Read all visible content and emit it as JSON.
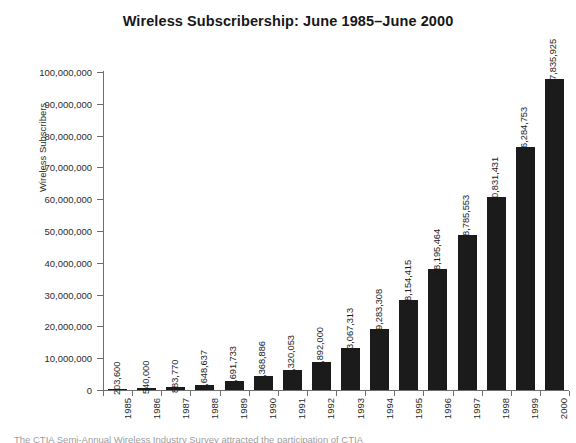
{
  "chart_data": {
    "type": "bar",
    "title": "Wireless Subscribership: June 1985–June 2000",
    "xlabel": "",
    "ylabel": "Wireless Subscribers",
    "ylim": [
      0,
      100000000
    ],
    "ytick_step": 10000000,
    "grid": false,
    "legend": null,
    "bar_color": "#1b1b1b",
    "categories": [
      "1985",
      "1986",
      "1987",
      "1988",
      "1989",
      "1990",
      "1991",
      "1992",
      "1993",
      "1994",
      "1995",
      "1996",
      "1997",
      "1998",
      "1999",
      "2000"
    ],
    "values": [
      203600,
      540000,
      883770,
      1648637,
      2691733,
      4368886,
      6320053,
      8892000,
      13067313,
      19283308,
      28154415,
      38195464,
      48785553,
      60831431,
      76284753,
      97835925
    ],
    "value_labels": [
      "203,600",
      "540,000",
      "883,770",
      "1,648,637",
      "2,691,733",
      "4,368,886",
      "6,320,053",
      "8,892,000",
      "13,067,313",
      "19,283,308",
      "28,154,415",
      "38,195,464",
      "48,785,553",
      "60,831,431",
      "76,284,753",
      "97,835,925"
    ],
    "ytick_labels": [
      "0",
      "10,000,000",
      "20,000,000",
      "30,000,000",
      "40,000,000",
      "50,000,000",
      "60,000,000",
      "70,000,000",
      "80,000,000",
      "90,000,000",
      "100,000,000"
    ],
    "ytick_values": [
      0,
      10000000,
      20000000,
      30000000,
      40000000,
      50000000,
      60000000,
      70000000,
      80000000,
      90000000,
      100000000
    ]
  },
  "caption": {
    "text": "The CTIA Semi-Annual Wireless Industry Survey attracted the participation of CTIA"
  }
}
